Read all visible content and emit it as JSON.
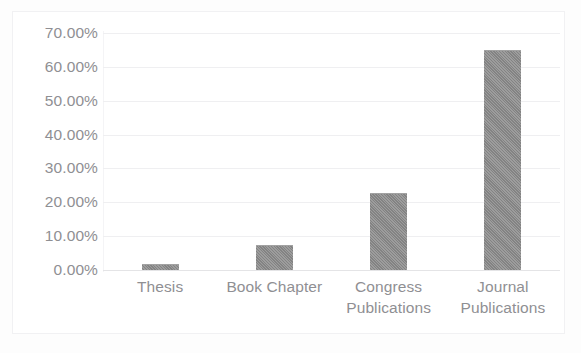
{
  "chart_data": {
    "type": "bar",
    "title": "",
    "subtitle": "",
    "xlabel": "",
    "ylabel": "",
    "categories": [
      "Thesis",
      "Book Chapter",
      "Congress Publications",
      "Journal Publications"
    ],
    "category_label_lines": [
      [
        "Thesis"
      ],
      [
        "Book Chapter"
      ],
      [
        "Congress",
        "Publications"
      ],
      [
        "Journal",
        "Publications"
      ]
    ],
    "values": [
      1.8,
      7.4,
      22.7,
      65.1
    ],
    "value_display": [
      "1.80%",
      "7.40%",
      "22.70%",
      "65.10%"
    ],
    "ylim": [
      0,
      70
    ],
    "ytick_values": [
      70,
      60,
      50,
      40,
      30,
      20,
      10,
      0
    ],
    "ytick_labels": [
      "70.00%",
      "60.00%",
      "50.00%",
      "40.00%",
      "30.00%",
      "20.00%",
      "10.00%",
      "0.00%"
    ],
    "grid": true,
    "grid_axis": "y",
    "legend": false,
    "legend_position": "none",
    "bar_color": "#8a8a8a",
    "gridline_color": "#efeff1",
    "axis_text_color": "#8f8f93",
    "plot_background": "#ffffff",
    "frame_border_color": "#f1f1f3",
    "units": "percent"
  },
  "figure": {
    "title_remnant": "",
    "frame_visible": true
  }
}
